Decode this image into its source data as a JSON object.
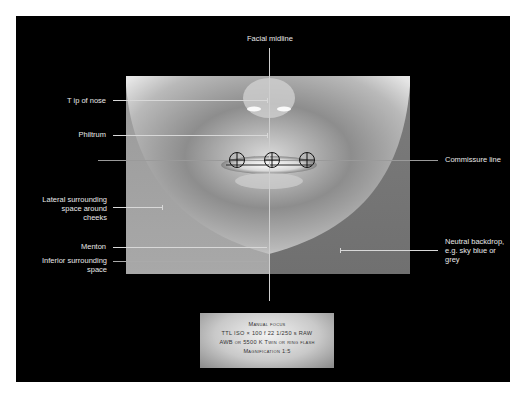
{
  "diagram": {
    "labels": {
      "facial_midline": "Facial midline",
      "tip_of_nose": "T ip of nose",
      "philtrum": "Philtrum",
      "commissure_line": "Commissure line",
      "lateral_space_1": "Lateral surrounding",
      "lateral_space_2": "space around",
      "lateral_space_3": "cheeks",
      "menton": "Menton",
      "inferior_space_1": "Inferior surrounding",
      "inferior_space_2": "space",
      "backdrop_1": "Neutral backdrop,",
      "backdrop_2": "e.g. sky blue or",
      "backdrop_3": "grey"
    },
    "markers": [
      "crosshair-left-commissure",
      "crosshair-center",
      "crosshair-right-commissure"
    ],
    "settings": {
      "line1": "Manual focus",
      "line2": "TTL  ISO × 100   f 22   1/250 s  RAW",
      "line3": "AWB or 5500 K   Twin or ring flash",
      "line4": "Magnification   1:5"
    }
  }
}
